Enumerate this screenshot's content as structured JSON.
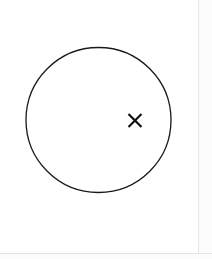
{
  "canvas": {
    "width": 212,
    "height": 259,
    "background_color": "#ffffff"
  },
  "figure": {
    "title": "",
    "caption": "",
    "shapes": [
      {
        "name": "circle-outline",
        "type": "circle",
        "center_x": 98.5,
        "center_y": 120,
        "radius": 72.5,
        "stroke_color": "#1a1a1a",
        "stroke_width": 1.3,
        "fill": "none",
        "bounds": {
          "left": 26,
          "top": 47,
          "right": 171,
          "bottom": 192
        }
      },
      {
        "name": "x-marker",
        "type": "x-mark",
        "center_x": 135,
        "center_y": 120.5,
        "half_size": 6.5,
        "stroke_color": "#111111",
        "stroke_width": 2.2,
        "glyph": "×",
        "label": "×"
      }
    ]
  },
  "page_edges": {
    "vertical_rule_x": 198,
    "vertical_rule_color": "#e6e6e6",
    "horizontal_rule_y": 253,
    "horizontal_rule_color": "#e3e3e3",
    "margin_fill_color": "#fcfcfc"
  },
  "icons": {
    "x_marker_icon": "x-mark-icon",
    "circle_icon": "circle-outline-icon"
  }
}
